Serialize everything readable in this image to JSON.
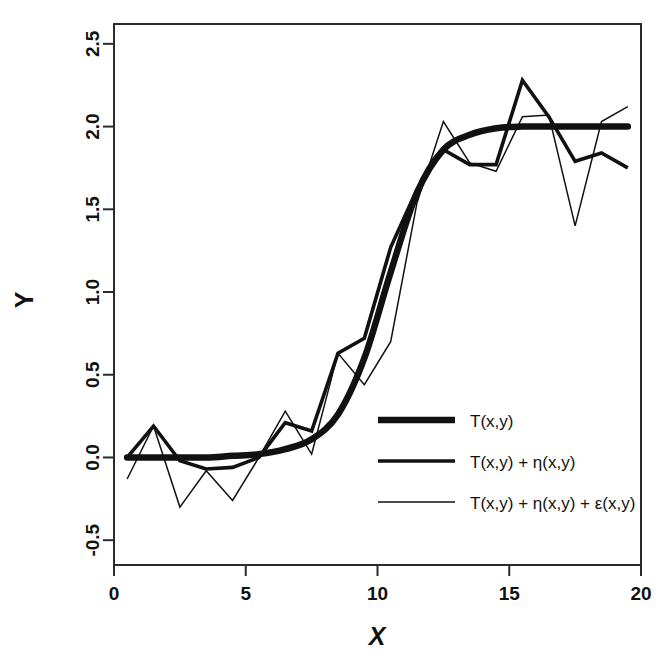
{
  "chart_data": {
    "type": "line",
    "title": "",
    "xlabel": "X",
    "ylabel": "Y",
    "xlim": [
      0,
      20
    ],
    "ylim": [
      -0.65,
      2.62
    ],
    "grid": false,
    "legend_position": "center-right",
    "x_ticks": [
      "0",
      "5",
      "10",
      "15",
      "20"
    ],
    "x_tick_values": [
      0,
      5,
      10,
      15,
      20
    ],
    "y_ticks": [
      "-0.5",
      "0.0",
      "0.5",
      "1.0",
      "1.5",
      "2.0",
      "2.5"
    ],
    "y_tick_values": [
      -0.5,
      0.0,
      0.5,
      1.0,
      1.5,
      2.0,
      2.5
    ],
    "x": [
      0.5,
      1.5,
      2.5,
      3.5,
      4.5,
      5.5,
      6.5,
      7.5,
      8.5,
      9.5,
      10.5,
      11.5,
      12.5,
      13.5,
      14.5,
      15.5,
      16.5,
      17.5,
      18.5,
      19.5
    ],
    "series": [
      {
        "name": "T(x,y)",
        "line_width": "thick",
        "values": [
          0.0,
          0.0,
          0.0,
          0.0,
          0.01,
          0.02,
          0.05,
          0.11,
          0.26,
          0.6,
          1.12,
          1.6,
          1.86,
          1.95,
          1.99,
          2.0,
          2.0,
          2.0,
          2.0,
          2.0
        ]
      },
      {
        "name": "T(x,y) + η(x,y)",
        "line_width": "medium",
        "values": [
          0.0,
          0.19,
          -0.02,
          -0.07,
          -0.06,
          0.0,
          0.21,
          0.16,
          0.63,
          0.72,
          1.27,
          1.62,
          1.86,
          1.77,
          1.77,
          2.28,
          2.06,
          1.79,
          1.84,
          1.75
        ]
      },
      {
        "name": "T(x,y) + η(x,y) + ε(x,y)",
        "line_width": "thin",
        "values": [
          -0.13,
          0.19,
          -0.3,
          -0.08,
          -0.26,
          0.0,
          0.28,
          0.02,
          0.63,
          0.44,
          0.7,
          1.54,
          2.03,
          1.78,
          1.73,
          2.06,
          2.07,
          1.4,
          2.03,
          2.12
        ]
      }
    ]
  },
  "legend": {
    "items": [
      {
        "label": "T(x,y)"
      },
      {
        "label": "T(x,y) + η(x,y)"
      },
      {
        "label": "T(x,y) + η(x,y) + ε(x,y)"
      }
    ]
  },
  "colors": {
    "foreground": "#111111",
    "frame": "#2b2b2b",
    "background": "#ffffff"
  }
}
